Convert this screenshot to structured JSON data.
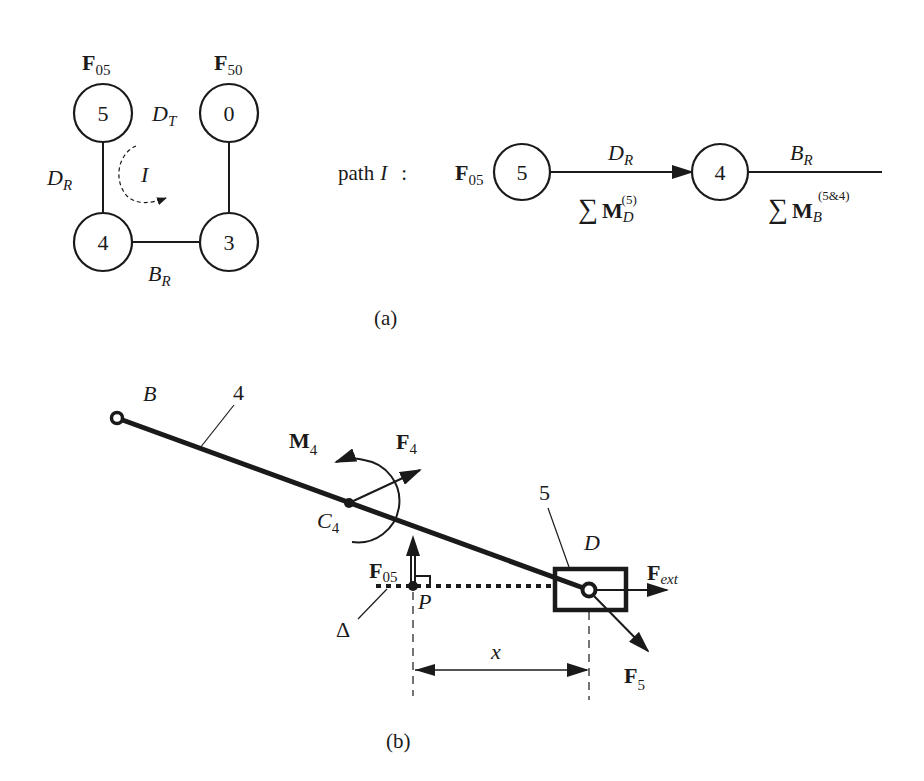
{
  "panel_a": {
    "caption": "(a)",
    "graph": {
      "nodes": [
        {
          "id": "5",
          "label": "5",
          "force_label": "F",
          "force_sub": "05"
        },
        {
          "id": "0",
          "label": "0",
          "force_label": "F",
          "force_sub": "50"
        },
        {
          "id": "4",
          "label": "4"
        },
        {
          "id": "3",
          "label": "3"
        }
      ],
      "edges": [
        {
          "from": "5",
          "to": "4",
          "label": "D",
          "sub": "R"
        },
        {
          "from": "4",
          "to": "3",
          "label": "B",
          "sub": "R"
        },
        {
          "from": "3",
          "to": "0",
          "label": "",
          "sub": ""
        },
        {
          "gap": "5-0",
          "label": "D",
          "sub": "T"
        }
      ],
      "loop_label": "I"
    },
    "path": {
      "prefix": "path",
      "loop": "I",
      "colon": ":",
      "start_force": "F",
      "start_force_sub": "05",
      "node1": "5",
      "node2": "4",
      "edge1_top": "D",
      "edge1_top_sub": "R",
      "edge1_bottom_sum": "∑",
      "edge1_bottom_M": "M",
      "edge1_bottom_sub": "D",
      "edge1_bottom_sup": "(5)",
      "edge2_top": "B",
      "edge2_top_sub": "R",
      "edge2_bottom_sum": "∑",
      "edge2_bottom_M": "M",
      "edge2_bottom_sub": "B",
      "edge2_bottom_sup": "(5&4)"
    }
  },
  "panel_b": {
    "caption": "(b)",
    "labels": {
      "B": "B",
      "link_number": "4",
      "slider_number": "5",
      "M4": "M",
      "M4_sub": "4",
      "F4": "F",
      "F4_sub": "4",
      "C4": "C",
      "C4_sub": "4",
      "D": "D",
      "Fext": "F",
      "Fext_sub": "ext",
      "F05": "F",
      "F05_sub": "05",
      "P": "P",
      "Delta": "Δ",
      "x": "x",
      "F5": "F",
      "F5_sub": "5"
    }
  }
}
